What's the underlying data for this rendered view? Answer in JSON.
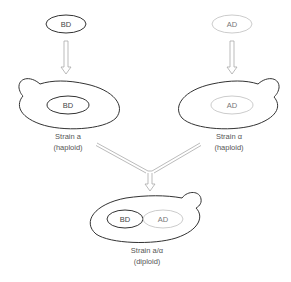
{
  "diagram": {
    "colors": {
      "dark_stroke": "#333333",
      "light_stroke": "#cccccc",
      "arrow_stroke": "#aaaaaa",
      "text": "#555555"
    },
    "top_left_plasmid": {
      "label": "BD"
    },
    "top_right_plasmid": {
      "label": "AD"
    },
    "strain_a": {
      "inner_label": "BD",
      "name": "Strain a",
      "ploidy": "(haploid)"
    },
    "strain_alpha": {
      "inner_label": "AD",
      "name": "Strain α",
      "ploidy": "(haploid)"
    },
    "diploid": {
      "inner_left_label": "BD",
      "inner_right_label": "AD",
      "name": "Strain a/α",
      "ploidy": "(diploid)"
    }
  }
}
